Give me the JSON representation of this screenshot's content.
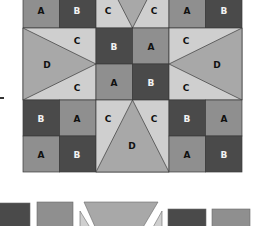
{
  "diagram": {
    "type": "quilt-block-layout",
    "colors": {
      "A": "#8f8f8f",
      "B": "#4a4a4a",
      "C": "#cfcfcf",
      "D": "#a8a8a8",
      "outline": "#3a3a3a"
    },
    "grid": {
      "rows": [
        [
          "A",
          "B",
          "C",
          "C",
          "A",
          "B"
        ],
        [
          "C",
          "C",
          "B",
          "A",
          "C",
          "C"
        ],
        [
          "C",
          "C",
          "A",
          "B",
          "C",
          "C"
        ],
        [
          "B",
          "A",
          "C",
          "C",
          "B",
          "A"
        ],
        [
          "A",
          "B",
          "D",
          "D",
          "A",
          "B"
        ]
      ]
    },
    "labels": {
      "r0": [
        "A",
        "B",
        "C",
        "C",
        "A",
        "B"
      ],
      "r1": [
        "C",
        "B",
        "A",
        "C"
      ],
      "r1_d_left": "D",
      "r1_d_right": "D",
      "r2": [
        "C",
        "A",
        "B",
        "C"
      ],
      "r3": [
        "B",
        "A",
        "C",
        "C",
        "B",
        "A"
      ],
      "r4": [
        "A",
        "B",
        "D",
        "A",
        "B"
      ]
    },
    "pieces_row": [
      "B",
      "A",
      "C",
      "D",
      "C",
      "B",
      "A"
    ]
  }
}
